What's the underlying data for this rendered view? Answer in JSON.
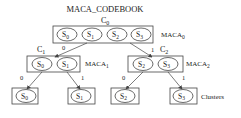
{
  "title": "MACA_CODEBOOK",
  "root": {
    "node_label": "C",
    "node_sub": "0",
    "maca_label": "MACA",
    "maca_sub": "0",
    "states": [
      {
        "s": "S",
        "sub": "0"
      },
      {
        "s": "S",
        "sub": "1"
      },
      {
        "s": "S",
        "sub": "2"
      },
      {
        "s": "S",
        "sub": "3"
      }
    ]
  },
  "edges": {
    "left_bit": "0",
    "right_bit": "1"
  },
  "left_child": {
    "node_label": "C",
    "node_sub": "1",
    "maca_label": "MACA",
    "maca_sub": "1",
    "states": [
      {
        "s": "S",
        "sub": "0"
      },
      {
        "s": "S",
        "sub": "1"
      }
    ],
    "edge_bits": [
      "0",
      "1"
    ]
  },
  "right_child": {
    "node_label": "C",
    "node_sub": "2",
    "maca_label": "MACA",
    "maca_sub": "2",
    "states": [
      {
        "s": "S",
        "sub": "2"
      },
      {
        "s": "S",
        "sub": "3"
      }
    ],
    "edge_bits": [
      "0",
      "1"
    ]
  },
  "leaves": [
    {
      "s": "S",
      "sub": "0"
    },
    {
      "s": "S",
      "sub": "1"
    },
    {
      "s": "S",
      "sub": "2"
    },
    {
      "s": "S",
      "sub": "3"
    }
  ],
  "leaves_label": "Clusters",
  "colors": {
    "stroke": "#444444",
    "text": "#222222",
    "background": "#ffffff"
  }
}
